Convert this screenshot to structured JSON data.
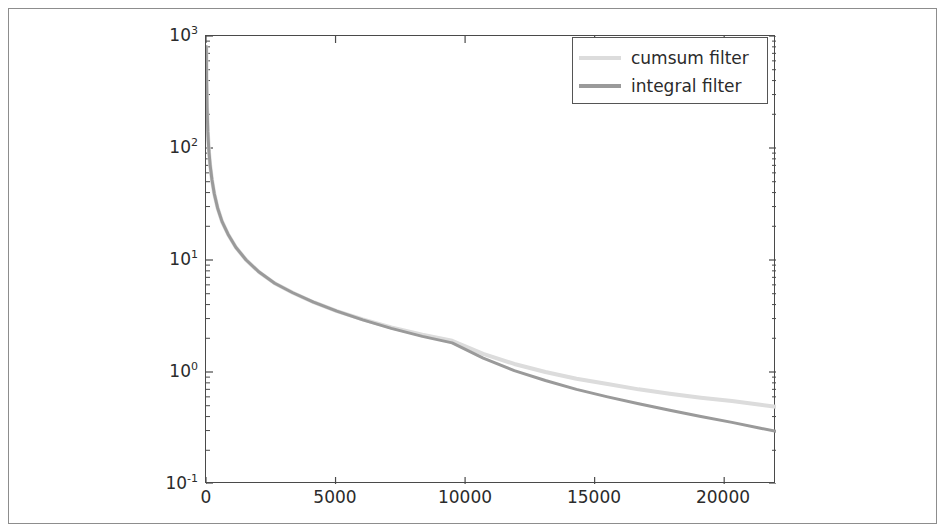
{
  "figure": {
    "background_color": "#ffffff",
    "frame_color": "#8d8d8d",
    "axes_color": "#4a4a4a"
  },
  "legend": {
    "position": "upper right",
    "border_color": "#555555",
    "entries": [
      {
        "label": "cumsum filter",
        "color": "#dcdcdc"
      },
      {
        "label": "integral filter",
        "color": "#9a9a9a"
      }
    ]
  },
  "chart_data": {
    "type": "line",
    "title": "",
    "xlabel": "",
    "ylabel": "",
    "xscale": "linear",
    "yscale": "log",
    "xlim": [
      0,
      22000
    ],
    "ylim": [
      0.1,
      1000
    ],
    "grid": false,
    "legend_position": "upper right",
    "xticks": [
      0,
      5000,
      10000,
      15000,
      20000
    ],
    "xtick_labels": [
      "0",
      "5000",
      "10000",
      "15000",
      "20000"
    ],
    "yticks": [
      0.1,
      1,
      10,
      100,
      1000
    ],
    "ytick_labels": [
      "10-1",
      "100",
      "101",
      "102",
      "103"
    ],
    "ytick_mantissas": [
      "10",
      "10",
      "10",
      "10",
      "10"
    ],
    "ytick_exponents": [
      "-1",
      "0",
      "1",
      "2",
      "3"
    ],
    "x": [
      10,
      20,
      40,
      70,
      110,
      160,
      230,
      320,
      450,
      620,
      850,
      1150,
      1550,
      2050,
      2650,
      3350,
      4150,
      5050,
      6050,
      7150,
      8350,
      9500,
      10700,
      11900,
      13100,
      14300,
      15500,
      16700,
      17900,
      19100,
      20300,
      21400,
      22000
    ],
    "series": [
      {
        "name": "cumsum filter",
        "color": "#dcdcdc",
        "linewidth": 4,
        "values": [
          800,
          420,
          230,
          140,
          95,
          70,
          52,
          39,
          29,
          22,
          17,
          13,
          10,
          7.8,
          6.2,
          5.1,
          4.2,
          3.5,
          2.95,
          2.5,
          2.15,
          1.9,
          1.45,
          1.18,
          1.0,
          0.87,
          0.78,
          0.7,
          0.64,
          0.59,
          0.55,
          0.51,
          0.49
        ]
      },
      {
        "name": "integral filter",
        "color": "#9a9a9a",
        "linewidth": 3,
        "values": [
          800,
          420,
          230,
          140,
          95,
          70,
          52,
          39,
          29,
          22,
          17,
          13,
          10,
          7.8,
          6.2,
          5.1,
          4.2,
          3.5,
          2.92,
          2.45,
          2.08,
          1.82,
          1.33,
          1.03,
          0.84,
          0.7,
          0.6,
          0.52,
          0.455,
          0.4,
          0.355,
          0.315,
          0.295
        ]
      }
    ]
  }
}
